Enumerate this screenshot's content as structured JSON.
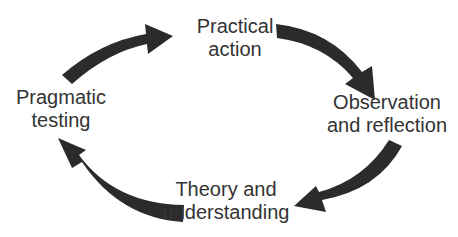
{
  "diagram": {
    "type": "cycle",
    "direction": "clockwise",
    "arrow_color": "#2b2b2b",
    "text_color": "#333333",
    "nodes": [
      {
        "id": "practical-action",
        "lines": [
          "Practical",
          "action"
        ]
      },
      {
        "id": "observation-reflection",
        "lines": [
          "Observation",
          "and reflection"
        ]
      },
      {
        "id": "theory-understanding",
        "lines": [
          "Theory and",
          "understanding"
        ]
      },
      {
        "id": "pragmatic-testing",
        "lines": [
          "Pragmatic",
          "testing"
        ]
      }
    ],
    "edges": [
      {
        "from": "pragmatic-testing",
        "to": "practical-action"
      },
      {
        "from": "practical-action",
        "to": "observation-reflection"
      },
      {
        "from": "observation-reflection",
        "to": "theory-understanding"
      },
      {
        "from": "theory-understanding",
        "to": "pragmatic-testing"
      }
    ]
  }
}
